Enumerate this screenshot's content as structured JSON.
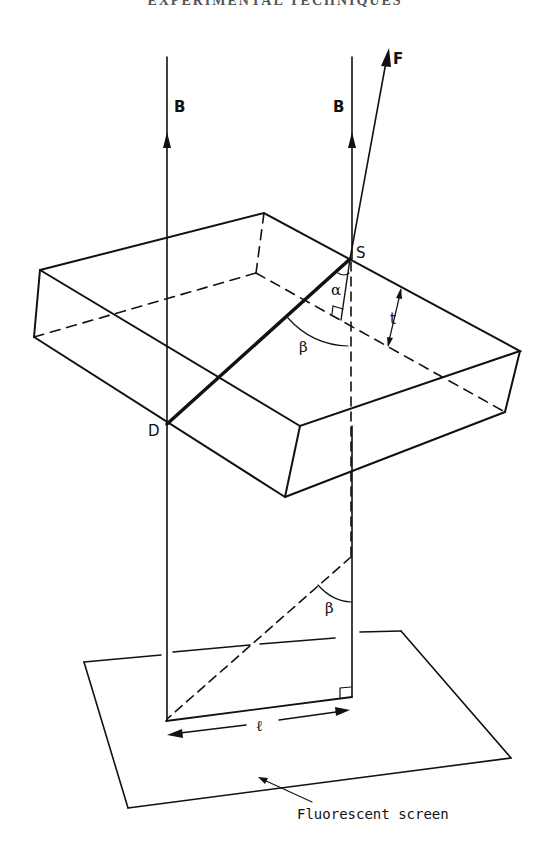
{
  "header": {
    "title": "EXPERIMENTAL TECHNIQUES"
  },
  "labels": {
    "beam_left": "B",
    "beam_right": "B",
    "force": "F",
    "point_s": "S",
    "point_d": "D",
    "alpha": "α",
    "beta_top": "β",
    "beta_bottom": "β",
    "thickness": "t",
    "length": "ℓ",
    "screen": "Fluorescent screen"
  },
  "colors": {
    "ink": "#111111",
    "background": "#ffffff"
  }
}
